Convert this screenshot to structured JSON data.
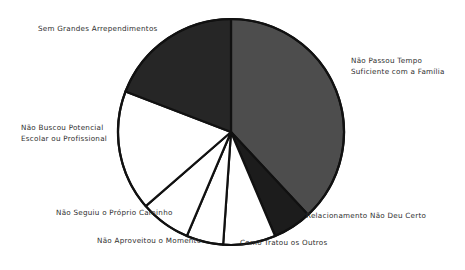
{
  "chart_data": {
    "type": "pie",
    "title": "",
    "subtitle": "",
    "xlabel": "",
    "ylabel": "",
    "legend_position": "labels-around-pie",
    "grid": false,
    "units": "degrees-of-circle",
    "categories": [
      "Não Passou Tempo Suficiente com a Família",
      "Relacionamento Não Deu Certo",
      "Como Tratou os Outros",
      "Não Aproveitou o Momento",
      "Não Seguiu o Próprio Caminho",
      "Não Buscou Potencial Escolar ou Profissional",
      "Sem Grandes Arrependimentos"
    ],
    "values": [
      38,
      6,
      7,
      5,
      7,
      18,
      19
    ],
    "slices": [
      {
        "key": "family",
        "label_lines": [
          "Não Passou Tempo",
          "Suficiente com a Família"
        ],
        "value": 38,
        "start_angle": 0,
        "end_angle": 137,
        "color": "#4d4d4d",
        "fill_style": "gray"
      },
      {
        "key": "relationship",
        "label_lines": [
          "Relacionamento Não Deu Certo"
        ],
        "value": 6,
        "start_angle": 137,
        "end_angle": 157,
        "color": "#1c1c1c",
        "fill_style": "dark"
      },
      {
        "key": "treated-others",
        "label_lines": [
          "Como Tratou os Outros"
        ],
        "value": 7,
        "start_angle": 157,
        "end_angle": 184,
        "color": "#ffffff",
        "fill_style": "white"
      },
      {
        "key": "moment",
        "label_lines": [
          "Não Aproveitou o Momento"
        ],
        "value": 5,
        "start_angle": 184,
        "end_angle": 203,
        "color": "#ffffff",
        "fill_style": "white"
      },
      {
        "key": "own-path",
        "label_lines": [
          "Não Seguiu o Próprio Caminho"
        ],
        "value": 7,
        "start_angle": 203,
        "end_angle": 229,
        "color": "#ffffff",
        "fill_style": "white"
      },
      {
        "key": "potential",
        "label_lines": [
          "Não Buscou Potencial",
          "Escolar ou Profissional"
        ],
        "value": 18,
        "start_angle": 229,
        "end_angle": 291,
        "color": "#ffffff",
        "fill_style": "white"
      },
      {
        "key": "no-regrets",
        "label_lines": [
          "Sem Grandes Arrependimentos"
        ],
        "value": 19,
        "start_angle": 291,
        "end_angle": 360,
        "color": "#262626",
        "fill_style": "dark"
      }
    ],
    "geometry": {
      "center_x": 231,
      "center_y": 132,
      "radius": 113,
      "stroke_color": "#111111",
      "stroke_width": 2.2
    }
  },
  "labels": {
    "no_regrets": "Sem Grandes Arrependimentos",
    "family_line1": "Não Passou Tempo",
    "family_line2": "Suficiente com a Família",
    "potential_line1": "Não Buscou Potencial",
    "potential_line2": "Escolar ou Profissional",
    "own_path": "Não Seguiu o Próprio Caminho",
    "moment": "Não Aproveitou o Momento",
    "treated_others": "Como Tratou os Outros",
    "relationship": "Relacionamento Não Deu Certo"
  }
}
